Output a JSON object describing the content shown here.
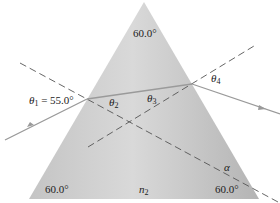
{
  "diagram": {
    "colors": {
      "prism_fill_light": "#cfcfcf",
      "prism_fill_dark": "#a9a9a9",
      "ray": "#9a9a9a",
      "normal": "#555555",
      "text": "#222222",
      "background": "#ffffff"
    },
    "prism": {
      "apex_angle_label": "60.0°",
      "left_angle_label": "60.0°",
      "right_angle_label": "60.0°",
      "medium_label": "n",
      "medium_subscript": "2"
    },
    "angles": {
      "theta1": {
        "symbol": "θ",
        "subscript": "1",
        "value_text": " = 55.0°"
      },
      "theta2": {
        "symbol": "θ",
        "subscript": "2"
      },
      "theta3": {
        "symbol": "θ",
        "subscript": "3"
      },
      "theta4": {
        "symbol": "θ",
        "subscript": "4"
      },
      "alpha": {
        "symbol": "α"
      }
    }
  }
}
